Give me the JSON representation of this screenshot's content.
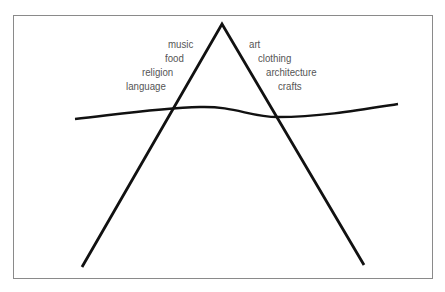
{
  "diagram": {
    "type": "cultural-iceberg-triangle",
    "left_labels": [
      {
        "text": "music"
      },
      {
        "text": "food"
      },
      {
        "text": "religion"
      },
      {
        "text": "language"
      }
    ],
    "right_labels": [
      {
        "text": "art"
      },
      {
        "text": "clothing"
      },
      {
        "text": "architecture"
      },
      {
        "text": "crafts"
      }
    ],
    "colors": {
      "line": "#111111",
      "text": "#555555",
      "border": "#8a8a8a",
      "background": "#ffffff"
    }
  }
}
